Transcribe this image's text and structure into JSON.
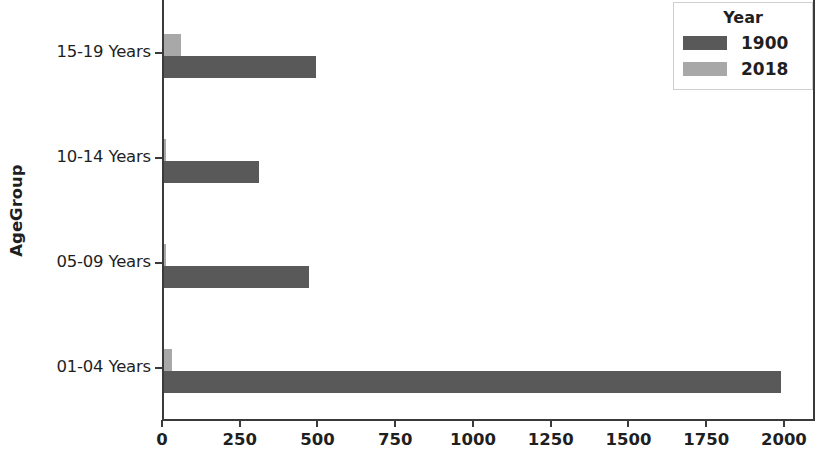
{
  "chart_data": {
    "type": "bar",
    "orientation": "horizontal",
    "title": "",
    "xlabel": "",
    "ylabel": "AgeGroup",
    "categories": [
      "15-19 Years",
      "10-14 Years",
      "05-09 Years",
      "01-04 Years"
    ],
    "series": [
      {
        "name": "1900",
        "color": "#595959",
        "values": [
          490,
          305,
          465,
          1985
        ]
      },
      {
        "name": "2018",
        "color": "#a8a8a8",
        "values": [
          55,
          7,
          5,
          25
        ]
      }
    ],
    "legend": {
      "title": "Year",
      "position": "upper right"
    },
    "xlim": [
      0,
      2100
    ],
    "xticks": [
      0,
      250,
      500,
      750,
      1000,
      1250,
      1500,
      1750,
      2000
    ],
    "xticklabels": [
      "0",
      "250",
      "500",
      "750",
      "1000",
      "1250",
      "1500",
      "1750",
      "2000"
    ],
    "grid": false
  }
}
